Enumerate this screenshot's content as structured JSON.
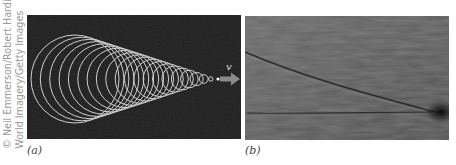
{
  "credit": {
    "line1": "© Neil Emmerson/Robert Harding",
    "line2": "World Imagery/Getty Images"
  },
  "panels": [
    {
      "label": "(a)",
      "description": "Diagram of wavefronts from a source moving faster than wave speed, forming a cone (shock wave)",
      "velocity_label": "v",
      "background": "#1c1c1c",
      "stroke": "#cfcfcf",
      "arrow_color": "#8a8a8a"
    },
    {
      "label": "(b)",
      "description": "Photograph of a V-shaped boat wake on water",
      "background": "#5e5e5e"
    }
  ]
}
